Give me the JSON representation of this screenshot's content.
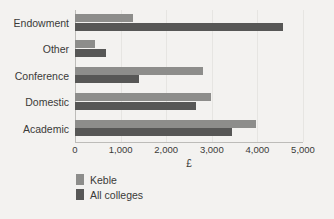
{
  "chart_data": {
    "type": "bar",
    "orientation": "horizontal",
    "title": "",
    "xlabel": "£",
    "ylabel": "",
    "xlim": [
      0,
      5000
    ],
    "xticks": [
      "0",
      "1,000",
      "2,000",
      "3,000",
      "4,000",
      "5,000"
    ],
    "xtick_values": [
      0,
      1000,
      2000,
      3000,
      4000,
      5000
    ],
    "grid": true,
    "legend_position": "bottom-left",
    "categories": [
      "Endowment",
      "Other",
      "Conference",
      "Domestic",
      "Academic"
    ],
    "series": [
      {
        "name": "Keble",
        "color": "#8d8d8b",
        "values": [
          1280,
          440,
          2800,
          2980,
          3970
        ]
      },
      {
        "name": "All colleges",
        "color": "#575756",
        "values": [
          4560,
          680,
          1400,
          2650,
          3440
        ]
      }
    ]
  },
  "legend": {
    "items": [
      {
        "label": "Keble",
        "swatch": "#8d8d8b"
      },
      {
        "label": "All colleges",
        "swatch": "#575756"
      }
    ]
  },
  "colors": {
    "background": "#f3f2f0",
    "text": "#3a3a38",
    "axis": "#bdbcb9",
    "grid": "#e6e5e2"
  }
}
